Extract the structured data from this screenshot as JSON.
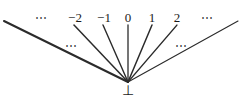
{
  "figure": {
    "kind": "flat-domain-lattice-diagram",
    "width": 243,
    "height": 105,
    "background_color": "#ffffff",
    "line_color": "#2b2b2b",
    "text_color": "#1a1a1a",
    "apex": {
      "x": 128,
      "y": 82
    },
    "bottom_element": {
      "label": "⊥",
      "icon_name": "bottom-symbol",
      "x": 128,
      "y": 84
    },
    "top_labels": [
      {
        "label": "⋯",
        "name": "top-ellipsis-left",
        "x": 42,
        "y": 12,
        "kind": "ellipsis"
      },
      {
        "label": "−2",
        "name": "label-minus-two",
        "x": 75,
        "y": 11,
        "kind": "value"
      },
      {
        "label": "−1",
        "name": "label-minus-one",
        "x": 104,
        "y": 11,
        "kind": "value"
      },
      {
        "label": "0",
        "name": "label-zero",
        "x": 128,
        "y": 11,
        "kind": "value"
      },
      {
        "label": "1",
        "name": "label-one",
        "x": 152,
        "y": 11,
        "kind": "value"
      },
      {
        "label": "2",
        "name": "label-two",
        "x": 177,
        "y": 11,
        "kind": "value"
      },
      {
        "label": "⋯",
        "name": "top-ellipsis-right",
        "x": 208,
        "y": 12,
        "kind": "ellipsis"
      }
    ],
    "mid_ellipses": [
      {
        "label": "⋯",
        "name": "mid-ellipsis-left",
        "x": 72,
        "y": 40
      },
      {
        "label": "⋯",
        "name": "mid-ellipsis-right",
        "x": 182,
        "y": 40
      }
    ],
    "edges": [
      {
        "name": "edge-far-left",
        "x1": 4,
        "y1": 21,
        "x2": 128,
        "y2": 82,
        "width": 2.1
      },
      {
        "name": "edge-minus-two",
        "x1": 74,
        "y1": 25,
        "x2": 128,
        "y2": 82,
        "width": 1.5
      },
      {
        "name": "edge-minus-one",
        "x1": 103,
        "y1": 25,
        "x2": 128,
        "y2": 82,
        "width": 1.4
      },
      {
        "name": "edge-zero",
        "x1": 128,
        "y1": 25,
        "x2": 128,
        "y2": 82,
        "width": 1.3
      },
      {
        "name": "edge-one",
        "x1": 152,
        "y1": 25,
        "x2": 128,
        "y2": 82,
        "width": 1.5
      },
      {
        "name": "edge-two",
        "x1": 177,
        "y1": 25,
        "x2": 128,
        "y2": 82,
        "width": 1.2
      },
      {
        "name": "edge-far-right",
        "x1": 238,
        "y1": 21,
        "x2": 128,
        "y2": 82,
        "width": 1.1
      }
    ]
  }
}
